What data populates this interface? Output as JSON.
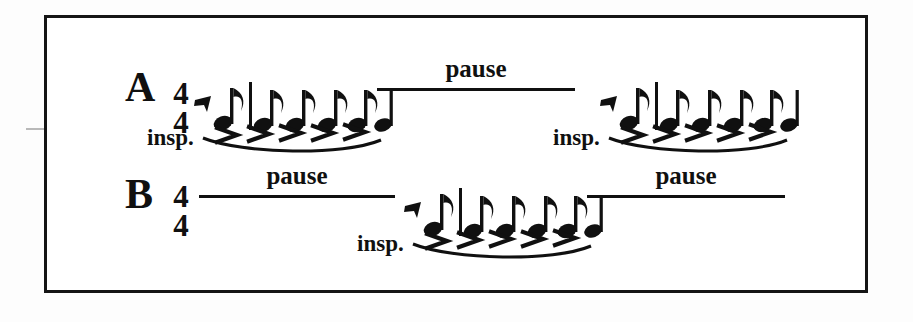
{
  "figure": {
    "type": "music-notation-breathing-pattern",
    "background_color": "#ffffff",
    "ink_color": "#101010",
    "border_color": "#151515",
    "rows": [
      {
        "id": "A",
        "label": "A",
        "time_signature": {
          "numerator": "4",
          "denominator": "4"
        },
        "segments": [
          {
            "kind": "inspiration",
            "label": "insp.",
            "rest": "eighth-rest",
            "notes": [
              "eighth",
              "barline",
              "eighth",
              "eighth",
              "eighth",
              "eighth",
              "quarter"
            ],
            "accent_count": 5,
            "accent_glyph": ">",
            "slur": true
          },
          {
            "kind": "pause",
            "label": "pause",
            "line": true
          },
          {
            "kind": "inspiration",
            "label": "insp.",
            "rest": "eighth-rest",
            "notes": [
              "eighth",
              "barline",
              "eighth",
              "eighth",
              "eighth",
              "eighth",
              "quarter"
            ],
            "accent_count": 5,
            "accent_glyph": ">",
            "slur": true
          }
        ]
      },
      {
        "id": "B",
        "label": "B",
        "time_signature": {
          "numerator": "4",
          "denominator": "4"
        },
        "segments": [
          {
            "kind": "pause",
            "label": "pause",
            "line": true
          },
          {
            "kind": "inspiration",
            "label": "insp.",
            "rest": "eighth-rest",
            "notes": [
              "eighth",
              "barline",
              "eighth",
              "eighth",
              "eighth",
              "eighth",
              "quarter"
            ],
            "accent_count": 5,
            "accent_glyph": ">",
            "slur": true
          },
          {
            "kind": "pause",
            "label": "pause",
            "line": true
          }
        ]
      }
    ],
    "labels": {
      "row_a": "A",
      "row_b": "B",
      "time_num": "4",
      "time_den": "4",
      "pause": "pause",
      "insp": "insp.",
      "accent": ">"
    }
  }
}
